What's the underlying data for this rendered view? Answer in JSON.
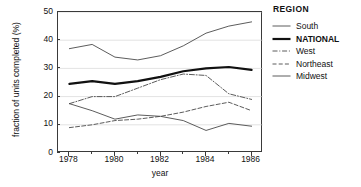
{
  "chart_data": {
    "type": "line",
    "title": "",
    "xlabel": "year",
    "ylabel": "fraction of units completed (%)",
    "x": [
      1978,
      1979,
      1980,
      1981,
      1982,
      1983,
      1984,
      1985,
      1986
    ],
    "xlim": [
      1977.5,
      1986.5
    ],
    "ylim": [
      0,
      50
    ],
    "ytick_labels": [
      "0",
      "10",
      "20",
      "30",
      "40",
      "50"
    ],
    "ytick_values": [
      0,
      10,
      20,
      30,
      40,
      50
    ],
    "xtick_labels": [
      "1978",
      "1980",
      "1982",
      "1984",
      "1986"
    ],
    "xtick_values": [
      1978,
      1980,
      1982,
      1984,
      1986
    ],
    "xtick_minor_values": [
      1979,
      1981,
      1983,
      1985
    ],
    "grid": "horizontal",
    "legend_position": "right",
    "legend_title": "REGION",
    "series": [
      {
        "name": "South",
        "style": "solid-thin",
        "color": "#4a4a4a",
        "width": 0.9,
        "values": [
          37,
          38.5,
          34,
          33,
          34.5,
          38,
          42.5,
          45,
          46.5
        ]
      },
      {
        "name": "NATIONAL",
        "style": "solid-thick",
        "color": "#111111",
        "width": 2.2,
        "values": [
          24.5,
          25.5,
          24.5,
          25.5,
          27,
          29,
          30,
          30.5,
          29.5
        ]
      },
      {
        "name": "West",
        "style": "dash-dot",
        "color": "#4a4a4a",
        "width": 0.9,
        "values": [
          17.5,
          20,
          20,
          23,
          26,
          28,
          27.5,
          21,
          19
        ]
      },
      {
        "name": "Northeast",
        "style": "dashed",
        "color": "#4a4a4a",
        "width": 0.9,
        "values": [
          9,
          10,
          11.5,
          12,
          13,
          14.5,
          16.5,
          18,
          15
        ]
      },
      {
        "name": "Midwest",
        "style": "solid-thin",
        "color": "#4a4a4a",
        "width": 0.9,
        "values": [
          17.5,
          15,
          12,
          13.5,
          13,
          11.5,
          8,
          10.5,
          9.5
        ]
      }
    ]
  },
  "axes": {
    "ylabel": "fraction of units completed (%)",
    "xlabel": "year"
  },
  "legend": {
    "title": "REGION",
    "items": [
      {
        "label": "South"
      },
      {
        "label": "NATIONAL"
      },
      {
        "label": "West"
      },
      {
        "label": "Northeast"
      },
      {
        "label": "Midwest"
      }
    ]
  }
}
